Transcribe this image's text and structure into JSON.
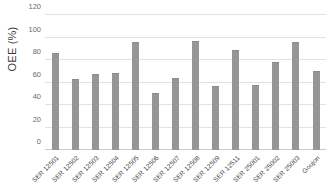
{
  "chart_data": {
    "type": "bar",
    "title": "",
    "xlabel": "",
    "ylabel": "OEE (%)",
    "ylim": [
      0,
      120
    ],
    "yticks": [
      0,
      20,
      40,
      60,
      80,
      100,
      120
    ],
    "grid": true,
    "legend": "none",
    "bar_color": "#969696",
    "categories": [
      "SER 12501",
      "SER 12502",
      "SER 12503",
      "SER 12504",
      "SER 12505",
      "SER 12506",
      "SER 12507",
      "SER 12508",
      "SER 12509",
      "SER 12511",
      "SER 25001",
      "SER 25002",
      "SER 25003",
      "Goujon"
    ],
    "values": [
      85,
      62,
      67,
      68,
      95,
      50,
      63,
      96,
      56,
      88,
      57,
      77,
      95,
      69
    ]
  }
}
